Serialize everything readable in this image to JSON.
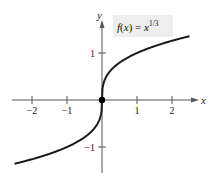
{
  "chart_data": {
    "type": "line",
    "title": "",
    "function_label": "f(x) = x^(1/3)",
    "function_label_parts": {
      "prefix": "f(x) = x",
      "exponent": "1/3"
    },
    "xlabel": "x",
    "ylabel": "y",
    "xlim": [
      -2.5,
      2.5
    ],
    "ylim": [
      -1.5,
      1.6
    ],
    "x_ticks": [
      -2,
      -1,
      1,
      2
    ],
    "x_tick_labels": [
      "−2",
      "−1",
      "1",
      "2"
    ],
    "y_ticks": [
      -1,
      1
    ],
    "y_tick_labels": [
      "−1",
      "1"
    ],
    "grid": false,
    "series": [
      {
        "name": "f(x) = x^(1/3)",
        "x": [
          -2.5,
          -2,
          -1.5,
          -1,
          -0.5,
          -0.125,
          0,
          0.125,
          0.5,
          1,
          1.5,
          2,
          2.5
        ],
        "y": [
          -1.357,
          -1.26,
          -1.145,
          -1,
          -0.794,
          -0.5,
          0,
          0.5,
          0.794,
          1,
          1.145,
          1.26,
          1.357
        ]
      }
    ],
    "marked_points": [
      {
        "x": 0,
        "y": 0,
        "label": "origin"
      }
    ],
    "colors": {
      "curve": "#1a1a1a",
      "axes": "#555555",
      "label_bg": "#eeeeee"
    }
  }
}
